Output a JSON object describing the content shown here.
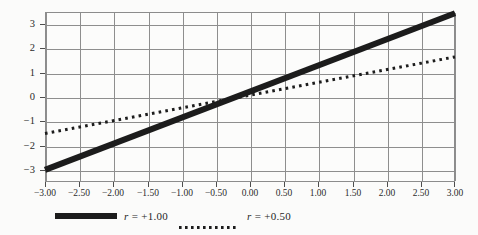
{
  "figure": {
    "background_color": "#fbfbfa",
    "plot_background_color": "#fcfcfb",
    "grid_color": "#8e8e8e",
    "axis_color": "#8c8c8c",
    "series_color": "#1c1c1c"
  },
  "chart_data": {
    "type": "line",
    "title": "",
    "subtitle": "",
    "xlabel": "",
    "ylabel": "",
    "xlim": [
      -3.0,
      3.0
    ],
    "ylim": [
      -3.5,
      3.5
    ],
    "grid": true,
    "legend_position": "bottom",
    "x_tick_labels": [
      "−3.00",
      "−2.50",
      "−2.00",
      "−1.50",
      "−1.00",
      "−0.50",
      "0.00",
      "0.50",
      "1.00",
      "1.50",
      "2.00",
      "2.50",
      "3.00"
    ],
    "x_tick_values": [
      -3.0,
      -2.5,
      -2.0,
      -1.5,
      -1.0,
      -0.5,
      0.0,
      0.5,
      1.0,
      1.5,
      2.0,
      2.5,
      3.0
    ],
    "y_tick_labels": [
      "3",
      "2",
      "1",
      "0",
      "−1",
      "−2",
      "−3"
    ],
    "y_tick_values": [
      3,
      2,
      1,
      0,
      -1,
      -2,
      -3
    ],
    "x": [
      -3.0,
      3.0
    ],
    "series": [
      {
        "name": "r = +1.00",
        "r_value": 1.0,
        "style": "solid",
        "line_width": 6,
        "color": "#1c1c1c",
        "values": [
          -3.0,
          3.45
        ]
      },
      {
        "name": "r = +0.50",
        "r_value": 0.5,
        "style": "dotted",
        "line_width": 3,
        "color": "#1c1c1c",
        "values": [
          -1.5,
          1.65
        ]
      }
    ]
  },
  "legend": {
    "entries": [
      {
        "symbol": "r",
        "relation": " = +1.00",
        "label": "r = +1.00",
        "marker": "solid-thick-line-swatch"
      },
      {
        "symbol": "r",
        "relation": " = +0.50",
        "label": "r = +0.50",
        "marker": "dotted-line-swatch"
      }
    ]
  }
}
